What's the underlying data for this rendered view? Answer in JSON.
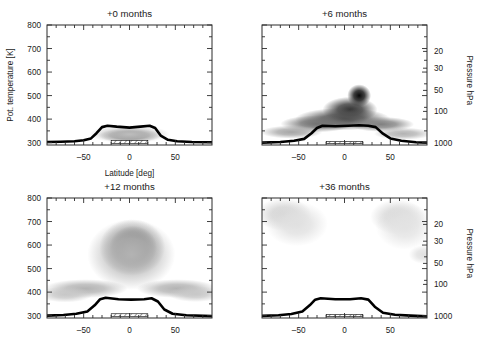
{
  "figure": {
    "yaxis_label": "Pot. temperature [K]",
    "xaxis_label": "Latitude [deg]",
    "pressure_axis_label": "Pressure  hPa"
  },
  "chart_data": {
    "type": "heatmap",
    "title": "",
    "xlabel": "Latitude [deg]",
    "ylabel": "Pot. temperature [K]",
    "y2label": "Pressure  hPa",
    "xlim": [
      -90,
      90
    ],
    "ylim": [
      290,
      800
    ],
    "xticks": [
      -50,
      0,
      50
    ],
    "xtick_labels": [
      "‒50",
      "0",
      "50"
    ],
    "yticks": [
      300,
      400,
      500,
      600,
      700,
      800
    ],
    "ytick_labels": [
      "300",
      "400",
      "500",
      "600",
      "700",
      "800"
    ],
    "y2ticks": [
      20,
      30,
      50,
      100,
      1000
    ],
    "y2tick_labels": [
      "20",
      "30",
      "50",
      "100",
      "1000"
    ],
    "grid": false,
    "legend": null,
    "colormap": "grayscale (white = low, black = high tracer concentration)",
    "panels": [
      {
        "id": "p0",
        "title": "+0 months",
        "row": 0,
        "col": 0,
        "show_ylabels": true,
        "show_y2labels": false,
        "show_xlabel": true,
        "description": "Narrow dark tracer layer confined just above the tropical tropopause between about 25S and 25N, peaking near 320-360 K.",
        "tropopause_theta": [
          {
            "lat": -90,
            "theta": 303
          },
          {
            "lat": -75,
            "theta": 304
          },
          {
            "lat": -60,
            "theta": 306
          },
          {
            "lat": -50,
            "theta": 310
          },
          {
            "lat": -42,
            "theta": 318
          },
          {
            "lat": -36,
            "theta": 340
          },
          {
            "lat": -30,
            "theta": 366
          },
          {
            "lat": -24,
            "theta": 372
          },
          {
            "lat": -14,
            "theta": 368
          },
          {
            "lat": 0,
            "theta": 364
          },
          {
            "lat": 12,
            "theta": 368
          },
          {
            "lat": 22,
            "theta": 372
          },
          {
            "lat": 28,
            "theta": 362
          },
          {
            "lat": 34,
            "theta": 330
          },
          {
            "lat": 42,
            "theta": 312
          },
          {
            "lat": 52,
            "theta": 306
          },
          {
            "lat": 68,
            "theta": 303
          },
          {
            "lat": 90,
            "theta": 302
          }
        ],
        "hatched_band": {
          "lat_min": -20,
          "lat_max": 20,
          "theta_min": 297,
          "theta_max": 309
        },
        "blobs": [
          {
            "cx": 0,
            "cy": 332,
            "rx": 24,
            "ry": 22,
            "intensity": 0.95
          },
          {
            "cx": 0,
            "cy": 330,
            "rx": 34,
            "ry": 30,
            "intensity": 0.55
          },
          {
            "cx": 0,
            "cy": 336,
            "rx": 44,
            "ry": 38,
            "intensity": 0.26
          }
        ]
      },
      {
        "id": "p6",
        "title": "+6 months",
        "row": 0,
        "col": 1,
        "show_ylabels": false,
        "show_y2labels": true,
        "show_xlabel": false,
        "description": "Tracer has spread upward and poleward; darkest core near 10-20N around 450-520 K with a broad dark layer hugging the tropopause across the tropics and southern midlatitudes.",
        "tropopause_theta": [
          {
            "lat": -90,
            "theta": 300
          },
          {
            "lat": -70,
            "theta": 303
          },
          {
            "lat": -55,
            "theta": 308
          },
          {
            "lat": -44,
            "theta": 316
          },
          {
            "lat": -36,
            "theta": 340
          },
          {
            "lat": -30,
            "theta": 362
          },
          {
            "lat": -24,
            "theta": 372
          },
          {
            "lat": -10,
            "theta": 370
          },
          {
            "lat": 4,
            "theta": 372
          },
          {
            "lat": 16,
            "theta": 374
          },
          {
            "lat": 26,
            "theta": 372
          },
          {
            "lat": 34,
            "theta": 366
          },
          {
            "lat": 42,
            "theta": 338
          },
          {
            "lat": 50,
            "theta": 318
          },
          {
            "lat": 62,
            "theta": 308
          },
          {
            "lat": 78,
            "theta": 302
          },
          {
            "lat": 90,
            "theta": 300
          }
        ],
        "hatched_band": {
          "lat_min": -20,
          "lat_max": 20,
          "theta_min": 296,
          "theta_max": 305
        },
        "blobs": [
          {
            "cx": 16,
            "cy": 500,
            "rx": 13,
            "ry": 48,
            "intensity": 0.97
          },
          {
            "cx": 6,
            "cy": 440,
            "rx": 30,
            "ry": 55,
            "intensity": 0.8
          },
          {
            "cx": -2,
            "cy": 400,
            "rx": 52,
            "ry": 48,
            "intensity": 0.7
          },
          {
            "cx": -30,
            "cy": 380,
            "rx": 40,
            "ry": 36,
            "intensity": 0.55
          },
          {
            "cx": 40,
            "cy": 378,
            "rx": 36,
            "ry": 32,
            "intensity": 0.5
          },
          {
            "cx": -58,
            "cy": 345,
            "rx": 34,
            "ry": 28,
            "intensity": 0.35
          },
          {
            "cx": 64,
            "cy": 338,
            "rx": 32,
            "ry": 26,
            "intensity": 0.3
          }
        ]
      },
      {
        "id": "p12",
        "title": "+12 months",
        "row": 1,
        "col": 0,
        "show_ylabels": true,
        "show_y2labels": false,
        "show_xlabel": false,
        "description": "A tall dark plume rises over the tropics with its darkest core near 0-10N at 550-620 K, tapering upward past 750 K, plus faint gray layers extending to both poles near 380-450 K.",
        "tropopause_theta": [
          {
            "lat": -90,
            "theta": 300
          },
          {
            "lat": -72,
            "theta": 303
          },
          {
            "lat": -58,
            "theta": 308
          },
          {
            "lat": -46,
            "theta": 318
          },
          {
            "lat": -38,
            "theta": 344
          },
          {
            "lat": -32,
            "theta": 370
          },
          {
            "lat": -26,
            "theta": 376
          },
          {
            "lat": -12,
            "theta": 370
          },
          {
            "lat": 2,
            "theta": 368
          },
          {
            "lat": 16,
            "theta": 370
          },
          {
            "lat": 24,
            "theta": 374
          },
          {
            "lat": 31,
            "theta": 360
          },
          {
            "lat": 38,
            "theta": 326
          },
          {
            "lat": 47,
            "theta": 308
          },
          {
            "lat": 62,
            "theta": 302
          },
          {
            "lat": 90,
            "theta": 298
          }
        ],
        "hatched_band": {
          "lat_min": -20,
          "lat_max": 20,
          "theta_min": 297,
          "theta_max": 308
        },
        "blobs": [
          {
            "cx": 5,
            "cy": 585,
            "rx": 17,
            "ry": 60,
            "intensity": 0.93
          },
          {
            "cx": 4,
            "cy": 590,
            "rx": 26,
            "ry": 92,
            "intensity": 0.72
          },
          {
            "cx": 3,
            "cy": 590,
            "rx": 36,
            "ry": 120,
            "intensity": 0.5
          },
          {
            "cx": 2,
            "cy": 560,
            "rx": 48,
            "ry": 150,
            "intensity": 0.3
          },
          {
            "cx": -48,
            "cy": 415,
            "rx": 46,
            "ry": 40,
            "intensity": 0.3
          },
          {
            "cx": 52,
            "cy": 415,
            "rx": 44,
            "ry": 40,
            "intensity": 0.3
          },
          {
            "cx": -70,
            "cy": 390,
            "rx": 30,
            "ry": 34,
            "intensity": 0.22
          },
          {
            "cx": 72,
            "cy": 392,
            "rx": 30,
            "ry": 34,
            "intensity": 0.22
          }
        ]
      },
      {
        "id": "p36",
        "title": "+36 months",
        "row": 1,
        "col": 1,
        "show_ylabels": false,
        "show_y2labels": true,
        "show_xlabel": false,
        "description": "Tracer is nearly washed out; only faint light-gray patches remain in both high-latitude upper regions above roughly 600 K.",
        "tropopause_theta": [
          {
            "lat": -90,
            "theta": 299
          },
          {
            "lat": -72,
            "theta": 302
          },
          {
            "lat": -58,
            "theta": 307
          },
          {
            "lat": -46,
            "theta": 318
          },
          {
            "lat": -38,
            "theta": 344
          },
          {
            "lat": -32,
            "theta": 368
          },
          {
            "lat": -26,
            "theta": 374
          },
          {
            "lat": -10,
            "theta": 370
          },
          {
            "lat": 6,
            "theta": 370
          },
          {
            "lat": 18,
            "theta": 374
          },
          {
            "lat": 26,
            "theta": 368
          },
          {
            "lat": 33,
            "theta": 338
          },
          {
            "lat": 42,
            "theta": 312
          },
          {
            "lat": 55,
            "theta": 304
          },
          {
            "lat": 72,
            "theta": 300
          },
          {
            "lat": 90,
            "theta": 297
          }
        ],
        "hatched_band": {
          "lat_min": -20,
          "lat_max": 20,
          "theta_min": 296,
          "theta_max": 305
        },
        "blobs": [
          {
            "cx": -66,
            "cy": 730,
            "rx": 30,
            "ry": 70,
            "intensity": 0.18
          },
          {
            "cx": -52,
            "cy": 690,
            "rx": 34,
            "ry": 95,
            "intensity": 0.12
          },
          {
            "cx": 58,
            "cy": 720,
            "rx": 30,
            "ry": 75,
            "intensity": 0.17
          },
          {
            "cx": 66,
            "cy": 680,
            "rx": 32,
            "ry": 100,
            "intensity": 0.11
          },
          {
            "cx": 86,
            "cy": 560,
            "rx": 16,
            "ry": 40,
            "intensity": 0.12
          }
        ]
      }
    ]
  }
}
